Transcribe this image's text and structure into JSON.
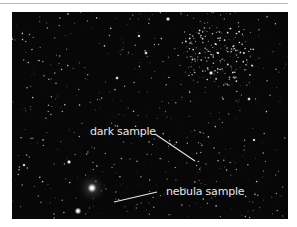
{
  "figure": {
    "colors": {
      "background": "#ffffff",
      "sky": "#070707",
      "rule": "#b8b8b8",
      "annotation": "#e6e6e6"
    }
  },
  "annotations": [
    {
      "id": "dark",
      "label": "dark sample",
      "text_x": 78,
      "text_y": 114,
      "line": [
        143,
        122,
        183,
        149
      ]
    },
    {
      "id": "nebula",
      "label": "nebula sample",
      "text_x": 154,
      "text_y": 174,
      "line": [
        145,
        180,
        102,
        190
      ]
    }
  ],
  "features": {
    "nebula": {
      "cx": 80,
      "cy": 176,
      "r": 16
    },
    "bright_stars": [
      {
        "x": 80,
        "y": 176,
        "r": 2.6
      },
      {
        "x": 66,
        "y": 199,
        "r": 2.0
      },
      {
        "x": 57,
        "y": 150,
        "r": 1.3
      },
      {
        "x": 156,
        "y": 7,
        "r": 1.3
      },
      {
        "x": 199,
        "y": 61,
        "r": 1.3
      },
      {
        "x": 134,
        "y": 41,
        "r": 1.1
      },
      {
        "x": 105,
        "y": 66,
        "r": 1.1
      },
      {
        "x": 127,
        "y": 24,
        "r": 1.0
      },
      {
        "x": 237,
        "y": 87,
        "r": 1.1
      },
      {
        "x": 206,
        "y": 41,
        "r": 1.0
      },
      {
        "x": 12,
        "y": 153,
        "r": 1.0
      },
      {
        "x": 242,
        "y": 128,
        "r": 1.0
      }
    ],
    "cluster": {
      "cx": 205,
      "cy": 45,
      "rx": 40,
      "ry": 32,
      "count": 170
    },
    "field_star_count": 650,
    "seed": 7
  }
}
